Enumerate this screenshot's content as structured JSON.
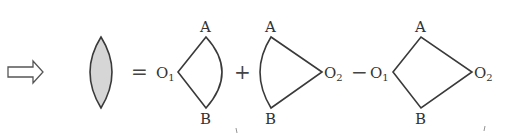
{
  "diagram": {
    "colors": {
      "stroke": "#3a3a3a",
      "lens_fill": "#d6d6d6",
      "arrow_fill": "#ffffff"
    },
    "operators": {
      "equals": "=",
      "plus": "+",
      "minus": "−"
    },
    "terms": [
      {
        "name": "lens",
        "shape": "shaded lens (intersection of two circles)",
        "labels": []
      },
      {
        "name": "sector-o1",
        "shape": "circular sector with center O1",
        "labels": {
          "center": "O",
          "center_sub": "1",
          "top": "A",
          "bottom": "B"
        }
      },
      {
        "name": "sector-o2",
        "shape": "circular sector with center O2",
        "labels": {
          "center": "O",
          "center_sub": "2",
          "top": "A",
          "bottom": "B"
        }
      },
      {
        "name": "quadrilateral",
        "shape": "quadrilateral O1-A-O2-B",
        "labels": {
          "left": "O",
          "left_sub": "1",
          "right": "O",
          "right_sub": "2",
          "top": "A",
          "bottom": "B"
        }
      }
    ]
  }
}
